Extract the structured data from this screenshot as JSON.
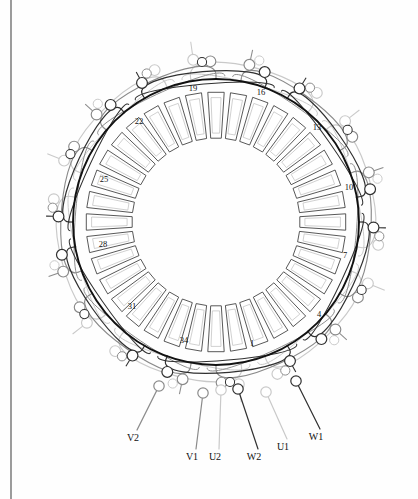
{
  "diagram": {
    "type": "stator-winding-schematic",
    "slot_count": 36,
    "phase_count": 3,
    "geometry": {
      "center_x": 216,
      "center_y": 222,
      "bore_radius": 143,
      "slot_outer_radius": 130,
      "slot_inner_radius": 84,
      "canvas_width": 418,
      "canvas_height": 499,
      "margin_line_x": 11
    },
    "colors": {
      "bore_circle": "#111111",
      "phase_w": "#303030",
      "phase_v": "#8a8a8a",
      "phase_u": "#c9c9c9",
      "slot_outline": "#3a3a3a",
      "slot_inner": "#bdbdbd",
      "background": "#fefefe",
      "text": "#111111"
    },
    "slot_labels": [
      {
        "number": "1",
        "slot": 1,
        "x": 252,
        "y": 346
      },
      {
        "number": "4",
        "slot": 4,
        "x": 319,
        "y": 317
      },
      {
        "number": "7",
        "slot": 7,
        "x": 345,
        "y": 258
      },
      {
        "number": "10",
        "slot": 10,
        "x": 349,
        "y": 190
      },
      {
        "number": "13",
        "slot": 13,
        "x": 317,
        "y": 130
      },
      {
        "number": "16",
        "slot": 16,
        "x": 261,
        "y": 95
      },
      {
        "number": "19",
        "slot": 19,
        "x": 193,
        "y": 91
      },
      {
        "number": "22",
        "slot": 22,
        "x": 139,
        "y": 124
      },
      {
        "number": "25",
        "slot": 25,
        "x": 104,
        "y": 182
      },
      {
        "number": "28",
        "slot": 28,
        "x": 103,
        "y": 247
      },
      {
        "number": "31",
        "slot": 31,
        "x": 132,
        "y": 309
      },
      {
        "number": "34",
        "slot": 34,
        "x": 184,
        "y": 343
      }
    ],
    "terminals": [
      {
        "label": "V2",
        "phase": "V",
        "x": 133,
        "y": 441,
        "lead_x": 159,
        "lead_y": 386,
        "color": "#8a8a8a"
      },
      {
        "label": "V1",
        "phase": "V",
        "x": 192,
        "y": 460,
        "lead_x": 203,
        "lead_y": 393,
        "color": "#8a8a8a"
      },
      {
        "label": "U2",
        "phase": "U",
        "x": 215,
        "y": 460,
        "lead_x": 221,
        "lead_y": 390,
        "color": "#c9c9c9"
      },
      {
        "label": "W2",
        "phase": "W",
        "x": 254,
        "y": 460,
        "lead_x": 238,
        "lead_y": 389,
        "color": "#303030"
      },
      {
        "label": "U1",
        "phase": "U",
        "x": 283,
        "y": 450,
        "lead_x": 266,
        "lead_y": 392,
        "color": "#c9c9c9"
      },
      {
        "label": "W1",
        "phase": "W",
        "x": 316,
        "y": 440,
        "lead_x": 296,
        "lead_y": 381,
        "color": "#303030"
      }
    ],
    "phases": [
      {
        "name": "U",
        "start_terminal": "U1",
        "end_terminal": "U2",
        "color": "#c9c9c9",
        "tone": "light"
      },
      {
        "name": "V",
        "start_terminal": "V1",
        "end_terminal": "V2",
        "color": "#8a8a8a",
        "tone": "medium"
      },
      {
        "name": "W",
        "start_terminal": "W1",
        "end_terminal": "W2",
        "color": "#303030",
        "tone": "dark"
      }
    ]
  }
}
